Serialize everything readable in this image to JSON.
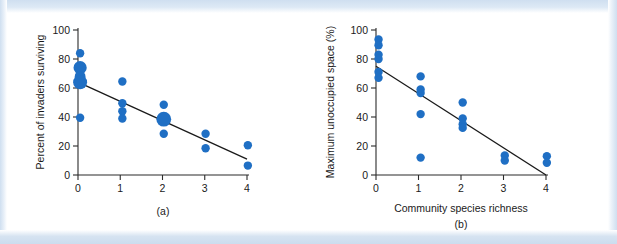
{
  "figure": {
    "background_color": "#ffffff",
    "band_color": "#cfdff0",
    "point_color": "#1f6fc4",
    "line_color": "#1a1a1a"
  },
  "chart_data": [
    {
      "type": "scatter",
      "panel_label": "(a)",
      "title": "",
      "xlabel": "",
      "ylabel": "Percent of invaders surviving",
      "xlim": [
        0,
        4
      ],
      "ylim": [
        0,
        100
      ],
      "xticks": [
        0,
        1,
        2,
        3,
        4
      ],
      "xticklabels": [
        "0",
        "1",
        "2",
        "3",
        "4"
      ],
      "yticks": [
        0,
        20,
        40,
        60,
        80,
        100
      ],
      "yticklabels": [
        "0",
        "20",
        "40",
        "60",
        "80",
        "100"
      ],
      "grid": false,
      "legend": "none",
      "points": [
        {
          "x": 0.05,
          "y": 84,
          "size": 4.2
        },
        {
          "x": 0.05,
          "y": 74,
          "size": 6.6
        },
        {
          "x": 0.05,
          "y": 68,
          "size": 5.4
        },
        {
          "x": 0.05,
          "y": 64,
          "size": 7.0
        },
        {
          "x": 0.05,
          "y": 39.5,
          "size": 4.2
        },
        {
          "x": 1.05,
          "y": 64.5,
          "size": 4.2
        },
        {
          "x": 1.05,
          "y": 49.5,
          "size": 4.2
        },
        {
          "x": 1.05,
          "y": 44,
          "size": 4.2
        },
        {
          "x": 1.05,
          "y": 39,
          "size": 4.2
        },
        {
          "x": 2.03,
          "y": 48.5,
          "size": 4.2
        },
        {
          "x": 2.03,
          "y": 38.5,
          "size": 7.4
        },
        {
          "x": 2.03,
          "y": 28.5,
          "size": 4.2
        },
        {
          "x": 3.02,
          "y": 28.5,
          "size": 4.2
        },
        {
          "x": 3.02,
          "y": 18.5,
          "size": 4.2
        },
        {
          "x": 4.02,
          "y": 20.5,
          "size": 4.2
        },
        {
          "x": 4.02,
          "y": 6.5,
          "size": 4.2
        }
      ],
      "fit_line": {
        "x0": 0,
        "y0": 64,
        "x1": 4,
        "y1": 11
      }
    },
    {
      "type": "scatter",
      "panel_label": "(b)",
      "title": "",
      "xlabel": "Community species richness",
      "ylabel": "Maximum unoccupied space (%)",
      "xlim": [
        0,
        4
      ],
      "ylim": [
        0,
        100
      ],
      "xticks": [
        0,
        1,
        2,
        3,
        4
      ],
      "xticklabels": [
        "0",
        "1",
        "2",
        "3",
        "4"
      ],
      "yticks": [
        0,
        20,
        40,
        60,
        80,
        100
      ],
      "yticklabels": [
        "0",
        "20",
        "40",
        "60",
        "80",
        "100"
      ],
      "grid": false,
      "legend": "none",
      "points": [
        {
          "x": 0.06,
          "y": 93.5,
          "size": 4.2
        },
        {
          "x": 0.06,
          "y": 89.5,
          "size": 4.2
        },
        {
          "x": 0.06,
          "y": 83,
          "size": 4.2
        },
        {
          "x": 0.06,
          "y": 80,
          "size": 4.2
        },
        {
          "x": 0.06,
          "y": 71,
          "size": 4.2
        },
        {
          "x": 0.06,
          "y": 67,
          "size": 4.2
        },
        {
          "x": 1.05,
          "y": 68,
          "size": 4.2
        },
        {
          "x": 1.05,
          "y": 59,
          "size": 4.2
        },
        {
          "x": 1.05,
          "y": 56.5,
          "size": 4.2
        },
        {
          "x": 1.05,
          "y": 42,
          "size": 4.2
        },
        {
          "x": 1.05,
          "y": 12,
          "size": 4.2
        },
        {
          "x": 2.04,
          "y": 50,
          "size": 4.2
        },
        {
          "x": 2.04,
          "y": 39,
          "size": 4.2
        },
        {
          "x": 2.04,
          "y": 35,
          "size": 4.2
        },
        {
          "x": 2.04,
          "y": 32.5,
          "size": 4.2
        },
        {
          "x": 3.03,
          "y": 13.5,
          "size": 4.2
        },
        {
          "x": 3.03,
          "y": 10,
          "size": 4.2
        },
        {
          "x": 4.02,
          "y": 13,
          "size": 4.2
        },
        {
          "x": 4.02,
          "y": 8.5,
          "size": 4.2
        }
      ],
      "fit_line": {
        "x0": 0,
        "y0": 75,
        "x1": 4,
        "y1": 0
      }
    }
  ]
}
